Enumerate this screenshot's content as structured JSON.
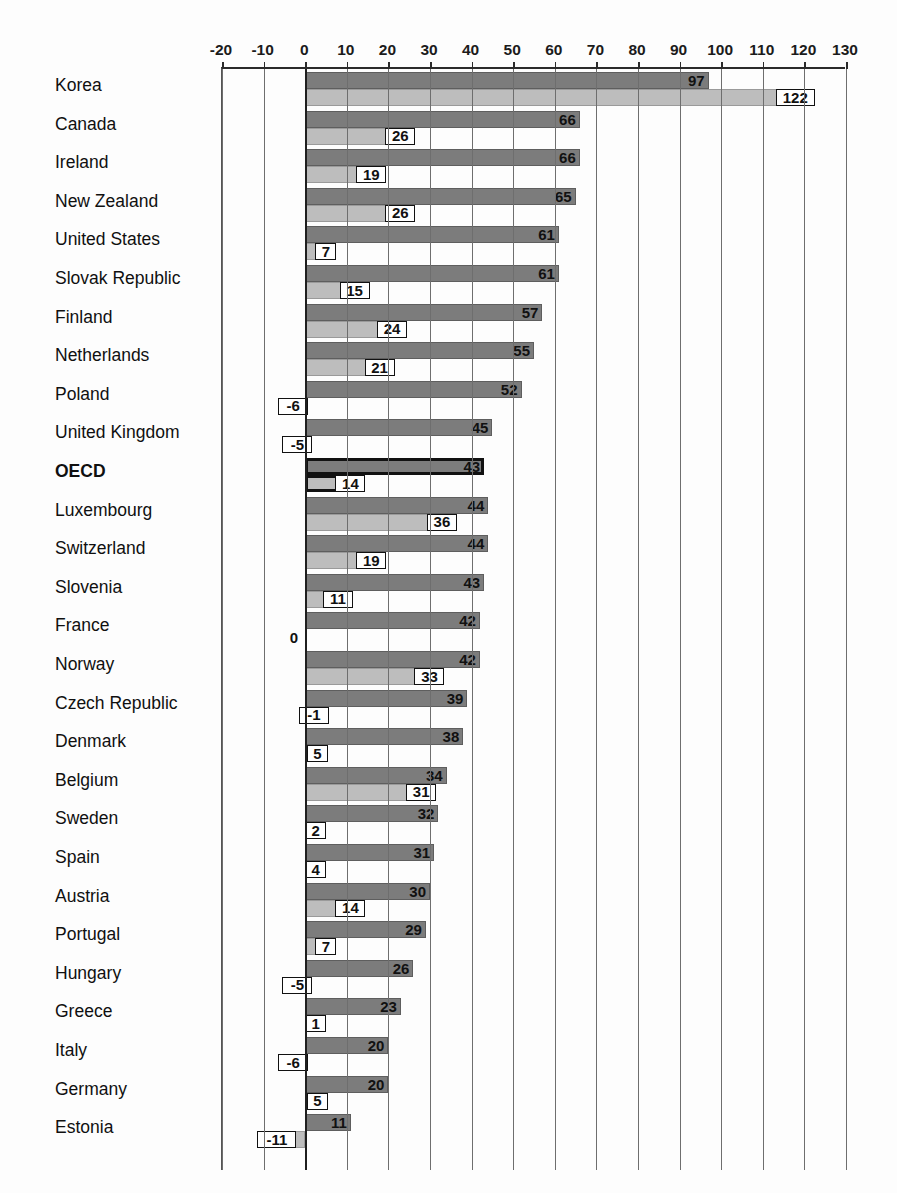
{
  "chart_data": {
    "type": "bar",
    "orientation": "horizontal",
    "title": "",
    "xlabel": "",
    "ylabel": "",
    "xlim": [
      -20,
      130
    ],
    "xticks": [
      -20,
      -10,
      0,
      10,
      20,
      30,
      40,
      50,
      60,
      70,
      80,
      90,
      100,
      110,
      120,
      130
    ],
    "grid": true,
    "legend": "none",
    "highlight_category": "OECD",
    "colors": {
      "series1": "#7c7c7c",
      "series2": "#bdbdbd",
      "axis": "#2b2b2b",
      "grid": "#6e6e6e",
      "text": "#111111"
    },
    "categories": [
      "Korea",
      "Canada",
      "Ireland",
      "New Zealand",
      "United States",
      "Slovak Republic",
      "Finland",
      "Netherlands",
      "Poland",
      "United Kingdom",
      "OECD",
      "Luxembourg",
      "Switzerland",
      "Slovenia",
      "France",
      "Norway",
      "Czech Republic",
      "Denmark",
      "Belgium",
      "Sweden",
      "Spain",
      "Austria",
      "Portugal",
      "Hungary",
      "Greece",
      "Italy",
      "Germany",
      "Estonia"
    ],
    "series": [
      {
        "name": "series-1-dark",
        "values": [
          97,
          66,
          66,
          65,
          61,
          61,
          57,
          55,
          52,
          45,
          43,
          44,
          44,
          43,
          42,
          42,
          39,
          38,
          34,
          32,
          31,
          30,
          29,
          26,
          23,
          20,
          20,
          11
        ]
      },
      {
        "name": "series-2-light",
        "values": [
          122,
          26,
          19,
          26,
          7,
          15,
          24,
          21,
          -6,
          -5,
          14,
          36,
          19,
          11,
          0,
          33,
          -1,
          5,
          31,
          2,
          4,
          14,
          7,
          -5,
          1,
          -6,
          5,
          -11
        ]
      }
    ]
  },
  "axis": {
    "ticks": [
      "-20",
      "-10",
      "0",
      "10",
      "20",
      "30",
      "40",
      "50",
      "60",
      "70",
      "80",
      "90",
      "100",
      "110",
      "120",
      "130"
    ]
  },
  "title_remnant": ""
}
